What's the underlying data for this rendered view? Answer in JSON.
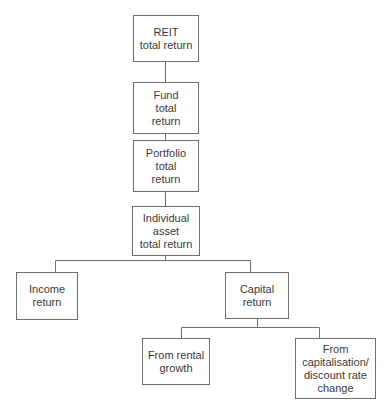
{
  "diagram": {
    "type": "hierarchy",
    "nodes": [
      {
        "id": "reit",
        "label": "REIT\ntotal return"
      },
      {
        "id": "fund",
        "label": "Fund\ntotal\nreturn"
      },
      {
        "id": "portfolio",
        "label": "Portfolio\ntotal\nreturn"
      },
      {
        "id": "individual",
        "label": "Individual\nasset\ntotal return"
      },
      {
        "id": "income",
        "label": "Income\nreturn"
      },
      {
        "id": "capital",
        "label": "Capital\nreturn"
      },
      {
        "id": "rental",
        "label": "From rental\ngrowth"
      },
      {
        "id": "capdisc",
        "label": "From\ncapitalisation/\ndiscount rate\nchange"
      }
    ],
    "edges": [
      {
        "from": "reit",
        "to": "fund"
      },
      {
        "from": "fund",
        "to": "portfolio"
      },
      {
        "from": "portfolio",
        "to": "individual"
      },
      {
        "from": "individual",
        "to": "income"
      },
      {
        "from": "individual",
        "to": "capital"
      },
      {
        "from": "capital",
        "to": "rental"
      },
      {
        "from": "capital",
        "to": "capdisc"
      }
    ]
  }
}
